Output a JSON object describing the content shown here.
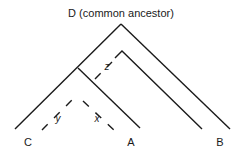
{
  "title": "D (common ancestor)",
  "leaves": {
    "c": "C",
    "a": "A",
    "b": "B"
  },
  "branch_labels": {
    "x": "x",
    "y": "y",
    "z": "z"
  },
  "colors": {
    "line": "#1a1a1a",
    "background": "#ffffff"
  }
}
